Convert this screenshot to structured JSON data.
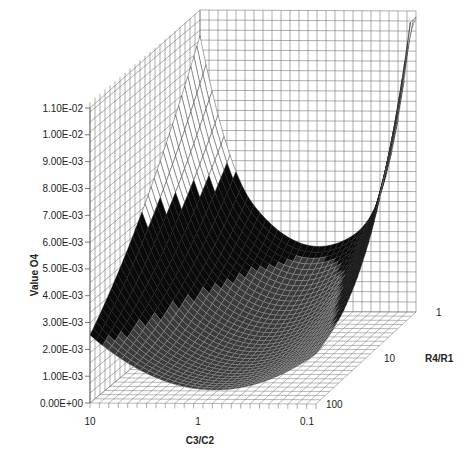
{
  "chart_data": {
    "type": "surface3d",
    "title": "",
    "zlabel": "Value O4",
    "xlabel": "C3/C2",
    "ylabel": "R4/R1",
    "z_ticks": [
      "0.00E+00",
      "1.00E-03",
      "2.00E-03",
      "3.00E-03",
      "4.00E-03",
      "5.00E-03",
      "6.00E-03",
      "7.00E-03",
      "8.00E-03",
      "9.00E-03",
      "1.00E-02",
      "1.10E-02"
    ],
    "x_ticks": [
      "10",
      "1",
      "0.1"
    ],
    "y_ticks": [
      "1",
      "10",
      "100"
    ],
    "zlim": [
      0,
      0.011
    ],
    "x_scale": "log",
    "y_scale": "log",
    "surface_notes": {
      "corner_x10_y1": 0.0071,
      "corner_x0.1_y1": 0.011,
      "min_region": "near C3/C2 0.3-1, R4/R1 10-100, approx 0.0005",
      "rim_height_approx": 0.005
    },
    "grid": true
  }
}
